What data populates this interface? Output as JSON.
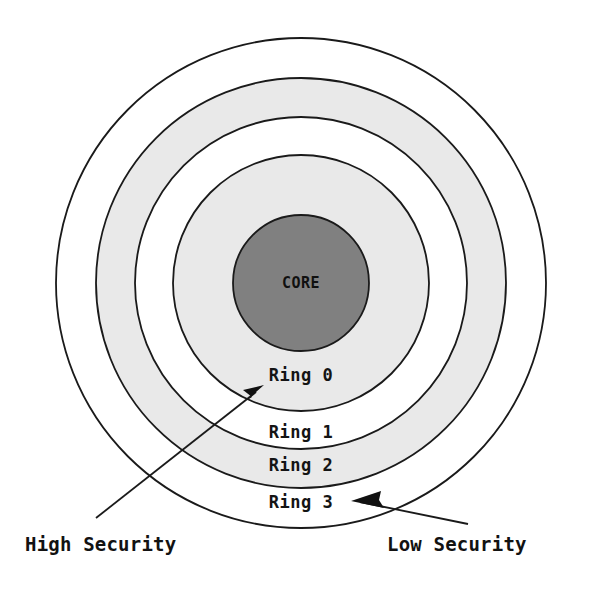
{
  "diagram": {
    "type": "concentric-security-rings",
    "background_color": "#ffffff",
    "stroke_color": "#1a1a1a",
    "core": {
      "label": "CORE",
      "fill": "#808080",
      "cx": 301,
      "cy": 283,
      "r": 68
    },
    "rings": [
      {
        "label": "Ring 0",
        "fill": "#e9e9e9",
        "r": 128,
        "label_x": 301,
        "label_y": 381
      },
      {
        "label": "Ring 1",
        "fill": "#ffffff",
        "r": 166,
        "label_x": 301,
        "label_y": 438
      },
      {
        "label": "Ring 2",
        "fill": "#e9e9e9",
        "r": 205,
        "label_x": 301,
        "label_y": 471
      },
      {
        "label": "Ring 3",
        "fill": "#ffffff",
        "r": 245,
        "label_x": 301,
        "label_y": 508
      }
    ],
    "callouts": [
      {
        "name": "high-security",
        "label": "High Security",
        "label_x": 25,
        "label_y": 551,
        "anchor": "start",
        "line_start_x": 96,
        "line_start_y": 518,
        "line_end_x": 262,
        "line_end_y": 388,
        "arrow_direction": "up-right"
      },
      {
        "name": "low-security",
        "label": "Low Security",
        "label_x": 387,
        "label_y": 551,
        "anchor": "start",
        "line_start_x": 468,
        "line_start_y": 524,
        "line_end_x": 352,
        "line_end_y": 501,
        "arrow_direction": "left"
      }
    ]
  }
}
